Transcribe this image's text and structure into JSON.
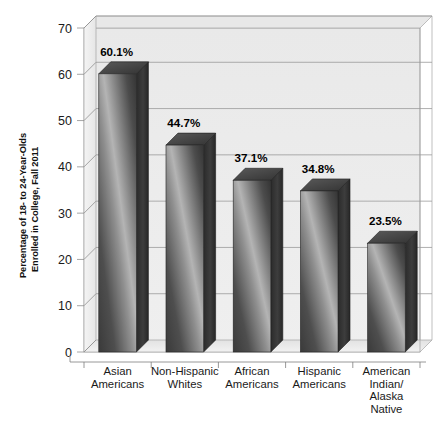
{
  "chart_data": {
    "type": "bar",
    "title": "",
    "subtitle": "",
    "xlabel": "",
    "ylabel": "Percentage of 18- to 24-Year-Olds Enrolled in College, Fall 2011",
    "ylabel_line1": "Percentage of 18- to 24-Year-Olds",
    "ylabel_line2": "Enrolled in College, Fall 2011",
    "categories": [
      "Asian Americans",
      "Non-Hispanic Whites",
      "African Americans",
      "Hispanic Americans",
      "American Indian/ Alaska Native"
    ],
    "category_lines": [
      [
        "Asian",
        "Americans"
      ],
      [
        "Non-Hispanic",
        "Whites"
      ],
      [
        "African",
        "Americans"
      ],
      [
        "Hispanic",
        "Americans"
      ],
      [
        "American",
        "Indian/",
        "Alaska",
        "Native"
      ]
    ],
    "values": [
      60.1,
      44.7,
      37.1,
      34.8,
      23.5
    ],
    "data_labels": [
      "60.1%",
      "44.7%",
      "37.1%",
      "34.8%",
      "23.5%"
    ],
    "ylim": [
      0,
      70
    ],
    "ytick_values": [
      0,
      10,
      20,
      30,
      40,
      50,
      60,
      70
    ],
    "ytick_labels": [
      "0",
      "10",
      "20",
      "30",
      "40",
      "50",
      "60",
      "70"
    ],
    "grid": true,
    "grid_axis": "y",
    "legend": false,
    "legend_position": "none",
    "style": "3d-bars-grayscale",
    "colors": {
      "plot_background": "#ececec",
      "floor": "#e4e4e4",
      "grid_line": "#9a9a9a",
      "axis_line": "#8c8c8c",
      "bar_front_dark": "#3b3b3b",
      "bar_front_light": "#b9b9b9",
      "bar_side": "#2e2e2e",
      "bar_top": "#4a4a4a",
      "page_background": "#ffffff",
      "text": "#1a1a1a"
    }
  }
}
